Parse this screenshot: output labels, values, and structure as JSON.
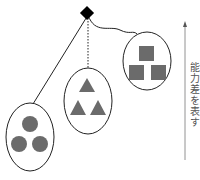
{
  "diagram": {
    "side_label": "能力差を表す",
    "colors": {
      "shape_fill": "#6b6b6b",
      "line": "#222222",
      "root": "#000000",
      "arrow": "#777777"
    },
    "root": {
      "shape": "diamond"
    },
    "groups": [
      {
        "shape": "circle",
        "count": 3,
        "connector": "solid"
      },
      {
        "shape": "triangle",
        "count": 3,
        "connector": "dotted"
      },
      {
        "shape": "square",
        "count": 3,
        "connector": "solid"
      }
    ]
  }
}
